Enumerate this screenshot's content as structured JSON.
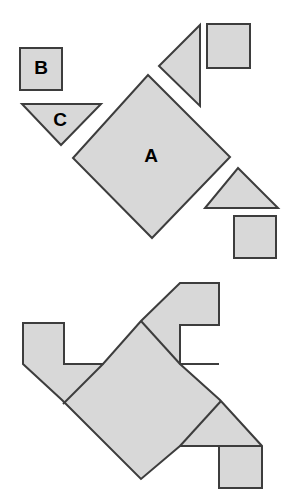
{
  "figure": {
    "canvas": {
      "width": 297,
      "height": 500
    },
    "style": {
      "fill": "#d8d8d8",
      "stroke": "#3d3d3d",
      "stroke_width": 2,
      "background": "#ffffff",
      "label_color": "#000000",
      "label_font_size": 19
    },
    "labels": [
      {
        "id": "label-a",
        "text": "A",
        "x": 151,
        "y": 157
      },
      {
        "id": "label-b",
        "text": "B",
        "x": 41,
        "y": 69
      },
      {
        "id": "label-c",
        "text": "C",
        "x": 60,
        "y": 121
      }
    ],
    "scattered_pieces": [
      {
        "id": "piece-a-large-square",
        "name": "large-square-a",
        "shape": "square",
        "label": "A",
        "points": "148,75 230,157 152,238 73,158"
      },
      {
        "id": "piece-b-small-square",
        "name": "small-square-b",
        "shape": "square",
        "label": "B",
        "points": "20,48 62,48 62,90 20,90"
      },
      {
        "id": "piece-c-triangle",
        "name": "triangle-c",
        "shape": "triangle",
        "label": "C",
        "points": "22,104 101,104 61,145"
      },
      {
        "id": "piece-top-right-triangle",
        "name": "left-pointing-triangle",
        "shape": "triangle",
        "label": "",
        "points": "200,25 200,106 159,66"
      },
      {
        "id": "piece-top-right-square",
        "name": "upper-right-square",
        "shape": "square",
        "label": "",
        "points": "207,24 250,24 250,68 207,68"
      },
      {
        "id": "piece-right-triangle",
        "name": "up-pointing-triangle",
        "shape": "triangle",
        "label": "",
        "points": "238,168 278,208 205,208"
      },
      {
        "id": "piece-bottom-right-square",
        "name": "lower-right-square",
        "shape": "square",
        "label": "",
        "points": "234,216 276,216 276,258 234,258"
      }
    ],
    "assembled_pieces": [
      {
        "id": "assembled-center-square",
        "name": "assembled-large-square",
        "shape": "square",
        "points": "141,321 220,400 141,479 62,400"
      },
      {
        "id": "assembled-upper-left-triangle",
        "name": "assembled-upper-left-triangle",
        "shape": "triangle",
        "points": "23,364 103,364 63,404"
      },
      {
        "id": "assembled-left-square",
        "name": "assembled-left-square",
        "points": "23,323 64,323 64,364 23,364"
      },
      {
        "id": "assembled-upper-right-triangle",
        "name": "assembled-upper-right-triangle",
        "shape": "triangle",
        "points": "180,283 180,364 140,323"
      },
      {
        "id": "assembled-top-right-square",
        "name": "assembled-top-right-square",
        "points": "180,283 219,283 219,325 180,325"
      },
      {
        "id": "assembled-neck-strip",
        "name": "assembled-neck-strip",
        "points": "180,325 219,325 219,364 180,364"
      },
      {
        "id": "assembled-lower-right-triangle",
        "name": "assembled-lower-right-triangle",
        "shape": "triangle",
        "points": "221,401 262,446 180,446"
      },
      {
        "id": "assembled-bottom-right-square",
        "name": "assembled-bottom-right-square",
        "points": "219,446 262,446 262,488 219,488"
      }
    ],
    "assembled_outline": "23,323 64,323 64,364 103,364 141,321 180,283 219,283 219,325 180,325 180,364 220,400 262,446 262,488 219,488 219,446 180,446 141,479 62,400 23,364",
    "assembled_internal_edges": [
      {
        "id": "edge-1",
        "x1": 63,
        "y1": 404,
        "x2": 103,
        "y2": 364
      },
      {
        "id": "edge-2",
        "x1": 64,
        "y1": 364,
        "x2": 103,
        "y2": 364
      },
      {
        "id": "edge-3",
        "x1": 141,
        "y1": 321,
        "x2": 180,
        "y2": 364
      },
      {
        "id": "edge-4",
        "x1": 180,
        "y1": 325,
        "x2": 219,
        "y2": 325
      },
      {
        "id": "edge-5",
        "x1": 180,
        "y1": 364,
        "x2": 219,
        "y2": 364
      },
      {
        "id": "edge-6",
        "x1": 180,
        "y1": 446,
        "x2": 221,
        "y2": 401
      },
      {
        "id": "edge-7",
        "x1": 219,
        "y1": 446,
        "x2": 262,
        "y2": 446
      }
    ]
  }
}
